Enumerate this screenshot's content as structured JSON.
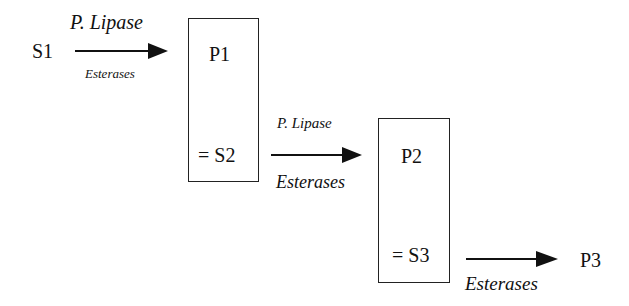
{
  "diagram": {
    "nodes": {
      "s1": "S1",
      "p1": "P1",
      "s2": "= S2",
      "p2": "P2",
      "s3": "= S3",
      "p3": "P3"
    },
    "edges": [
      {
        "from": "S1",
        "to": "P1",
        "top_label": "P. Lipase",
        "bottom_label": "Esterases"
      },
      {
        "from": "S2",
        "to": "P2",
        "top_label": "P. Lipase",
        "bottom_label": "Esterases"
      },
      {
        "from": "S3",
        "to": "P3",
        "bottom_label": "Esterases"
      }
    ]
  }
}
